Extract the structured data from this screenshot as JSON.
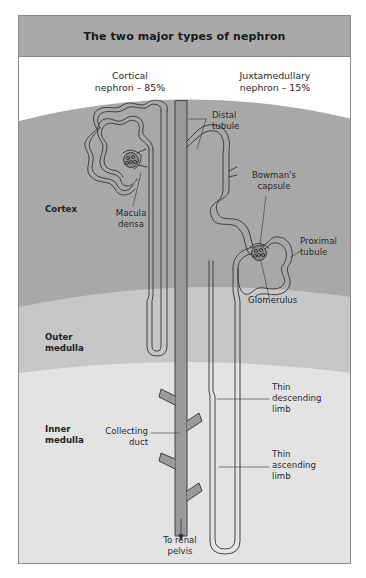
{
  "title": "The two major types of nephron",
  "nephron_types": [
    {
      "name": "Cortical",
      "line2": "nephron – 85%"
    },
    {
      "name": "Juxtamedullary",
      "line2": "nephron – 15%"
    }
  ],
  "regions": {
    "cortex": "Cortex",
    "outer_medulla_l1": "Outer",
    "outer_medulla_l2": "medulla",
    "inner_medulla_l1": "Inner",
    "inner_medulla_l2": "medulla"
  },
  "labels": {
    "distal_tubule_l1": "Distal",
    "distal_tubule_l2": "tubule",
    "macula_densa_l1": "Macula",
    "macula_densa_l2": "densa",
    "bowmans_capsule_l1": "Bowman's",
    "bowmans_capsule_l2": "capsule",
    "proximal_tubule_l1": "Proximal",
    "proximal_tubule_l2": "tubule",
    "glomerulus": "Glomerulus",
    "thin_descending_l1": "Thin",
    "thin_descending_l2": "descending",
    "thin_descending_l3": "limb",
    "collecting_duct_l1": "Collecting",
    "collecting_duct_l2": "duct",
    "thin_ascending_l1": "Thin",
    "thin_ascending_l2": "ascending",
    "thin_ascending_l3": "limb",
    "renal_pelvis_l1": "To renal",
    "renal_pelvis_l2": "pelvis"
  },
  "colors": {
    "title_bar": "#a9a9a9",
    "cortex": "#a8a8a8",
    "outer_medulla": "#c6c6c6",
    "inner_medulla": "#e3e3e3",
    "tubule": "#9a9a9a",
    "outline": "#333333"
  }
}
